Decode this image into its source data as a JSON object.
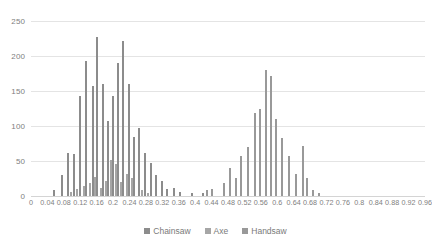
{
  "chart_data": {
    "type": "bar",
    "title": "",
    "subtitle": "",
    "xlabel": "",
    "ylabel": "",
    "xlim": [
      0,
      0.96
    ],
    "ylim": [
      0,
      250
    ],
    "grid": true,
    "legend_position": "bottom",
    "y_ticks": [
      0,
      50,
      100,
      150,
      200,
      250
    ],
    "y_tick_labels": [
      "0",
      "50",
      "100",
      "150",
      "200",
      "250"
    ],
    "x_ticks": [
      0,
      0.04,
      0.08,
      0.12,
      0.16,
      0.2,
      0.24,
      0.28,
      0.32,
      0.36,
      0.4,
      0.44,
      0.48,
      0.52,
      0.56,
      0.6,
      0.64,
      0.68,
      0.72,
      0.76,
      0.8,
      0.84,
      0.88,
      0.92,
      0.96
    ],
    "x_tick_labels": [
      "0",
      "0.04",
      "0.08",
      "0.12",
      "0.16",
      "0.2",
      "0.24",
      "0.28",
      "0.32",
      "0.36",
      "0.4",
      "0.44",
      "0.48",
      "0.52",
      "0.56",
      "0.6",
      "0.64",
      "0.68",
      "0.72",
      "0.76",
      "0.8",
      "0.84",
      "0.88",
      "0.92",
      "0.96"
    ],
    "series": [
      {
        "name": "Chainsaw",
        "color": "#8c8c8c",
        "points": [
          {
            "x": 0.055,
            "y": 8
          },
          {
            "x": 0.075,
            "y": 30
          },
          {
            "x": 0.09,
            "y": 62
          },
          {
            "x": 0.105,
            "y": 60
          },
          {
            "x": 0.12,
            "y": 143
          },
          {
            "x": 0.135,
            "y": 193
          },
          {
            "x": 0.15,
            "y": 157
          },
          {
            "x": 0.162,
            "y": 227
          },
          {
            "x": 0.175,
            "y": 160
          },
          {
            "x": 0.188,
            "y": 107
          },
          {
            "x": 0.2,
            "y": 143
          },
          {
            "x": 0.212,
            "y": 190
          },
          {
            "x": 0.225,
            "y": 222
          },
          {
            "x": 0.238,
            "y": 160
          },
          {
            "x": 0.25,
            "y": 85
          },
          {
            "x": 0.262,
            "y": 97
          },
          {
            "x": 0.278,
            "y": 62
          },
          {
            "x": 0.292,
            "y": 47
          },
          {
            "x": 0.305,
            "y": 30
          },
          {
            "x": 0.318,
            "y": 22
          },
          {
            "x": 0.332,
            "y": 10
          },
          {
            "x": 0.348,
            "y": 12
          },
          {
            "x": 0.362,
            "y": 6
          },
          {
            "x": 0.392,
            "y": 4
          },
          {
            "x": 0.418,
            "y": 5
          }
        ]
      },
      {
        "name": "Axe",
        "color": "#a6a6a6",
        "points": [
          {
            "x": 0.098,
            "y": 6
          },
          {
            "x": 0.112,
            "y": 10
          },
          {
            "x": 0.128,
            "y": 14
          },
          {
            "x": 0.143,
            "y": 18
          },
          {
            "x": 0.157,
            "y": 27
          },
          {
            "x": 0.17,
            "y": 12
          },
          {
            "x": 0.183,
            "y": 22
          },
          {
            "x": 0.196,
            "y": 52
          },
          {
            "x": 0.208,
            "y": 46
          },
          {
            "x": 0.22,
            "y": 20
          },
          {
            "x": 0.233,
            "y": 32
          },
          {
            "x": 0.246,
            "y": 26
          },
          {
            "x": 0.27,
            "y": 8
          },
          {
            "x": 0.285,
            "y": 5
          }
        ]
      },
      {
        "name": "Handsaw",
        "color": "#999999",
        "points": [
          {
            "x": 0.428,
            "y": 9
          },
          {
            "x": 0.442,
            "y": 10
          },
          {
            "x": 0.47,
            "y": 18
          },
          {
            "x": 0.485,
            "y": 40
          },
          {
            "x": 0.5,
            "y": 26
          },
          {
            "x": 0.512,
            "y": 57
          },
          {
            "x": 0.528,
            "y": 70
          },
          {
            "x": 0.545,
            "y": 118
          },
          {
            "x": 0.558,
            "y": 125
          },
          {
            "x": 0.572,
            "y": 180
          },
          {
            "x": 0.585,
            "y": 172
          },
          {
            "x": 0.598,
            "y": 110
          },
          {
            "x": 0.612,
            "y": 83
          },
          {
            "x": 0.628,
            "y": 57
          },
          {
            "x": 0.645,
            "y": 32
          },
          {
            "x": 0.662,
            "y": 72
          },
          {
            "x": 0.672,
            "y": 26
          },
          {
            "x": 0.688,
            "y": 9
          },
          {
            "x": 0.702,
            "y": 5
          }
        ]
      }
    ]
  }
}
